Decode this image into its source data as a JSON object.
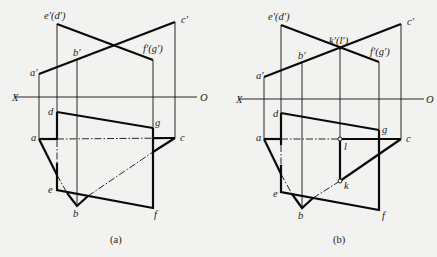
{
  "figures": [
    {
      "id": "a",
      "caption": "(a)",
      "labels": {
        "e_prime_d_prime": "e′(d′)",
        "c_prime": "c′",
        "b_prime": "b′",
        "f_prime_g_prime": "f′(g′)",
        "a_prime": "a′",
        "X": "X",
        "O": "O",
        "d": "d",
        "g": "g",
        "a": "a",
        "c": "c",
        "e": "e",
        "b": "b",
        "f": "f"
      }
    },
    {
      "id": "b",
      "caption": "(b)",
      "labels": {
        "e_prime_d_prime": "e′(d′)",
        "k_prime_l_prime": "k′(l′)",
        "c_prime": "c′",
        "b_prime": "b′",
        "f_prime_g_prime": "f′(g′)",
        "a_prime": "a′",
        "X": "X",
        "O": "O",
        "d": "d",
        "g": "g",
        "a": "a",
        "l": "l",
        "c": "c",
        "k": "k",
        "e": "e",
        "b": "b",
        "f": "f"
      }
    }
  ],
  "colors": {
    "background": "#f2f2f0",
    "ink": "#111111"
  }
}
